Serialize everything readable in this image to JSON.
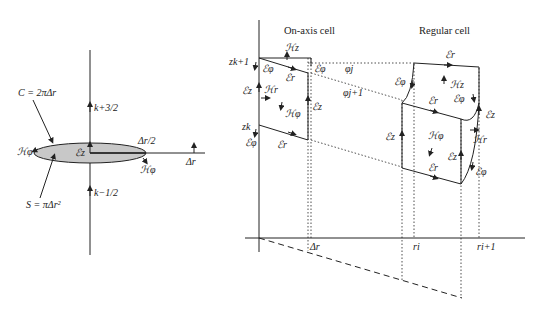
{
  "left_panel": {
    "circumference_label": "C = 2πΔr",
    "area_label": "S = πΔr²",
    "k_upper": "k+3/2",
    "k_lower": "k−1/2",
    "half_dr": "Δr/2",
    "dr": "Δr",
    "Ez": "ℰz",
    "H_phi_left": "ℋφ",
    "H_phi_right": "ℋφ"
  },
  "right_panel": {
    "on_axis_title": "On-axis cell",
    "regular_title": "Regular cell",
    "z_k1": "zk+1",
    "z_k": "zk",
    "phi_j": "φj",
    "phi_j1": "φj+1",
    "dr": "Δr",
    "r_i": "ri",
    "r_i1": "ri+1",
    "on_axis": {
      "Hz": "ℋz",
      "Ephi_a": "ℰφ",
      "Er_a": "ℰr",
      "Ephi_b": "ℰφ",
      "Ez_left": "ℰz",
      "Hr": "ℋr",
      "Hphi": "ℋφ",
      "Ez_right": "ℰz",
      "Ephi_c": "ℰφ",
      "Er_b": "ℰr"
    },
    "regular": {
      "Er_top": "ℰr",
      "Ephi_left": "ℰφ",
      "Hz": "ℋz",
      "Ephi_right": "ℰφ",
      "Er_mid": "ℰr",
      "Ez_far": "ℰz",
      "Ez_left": "ℰz",
      "Hphi": "ℋφ",
      "Hr": "ℋr",
      "Ez_front": "ℰz",
      "Er_bottom": "ℰr",
      "Ephi_bottom": "ℰφ"
    }
  }
}
